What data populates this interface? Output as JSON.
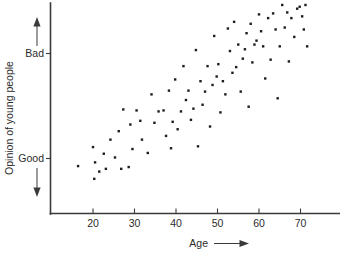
{
  "chart_data": {
    "type": "scatter",
    "title": "",
    "xlabel": "Age",
    "ylabel": "Opinion of young people",
    "xlabel_suffix_icon": "right-arrow",
    "xlim": [
      12,
      78
    ],
    "ylim": [
      0,
      1
    ],
    "grid": false,
    "legend": null,
    "x_ticks": [
      20,
      30,
      40,
      50,
      60,
      70
    ],
    "x_tick_labels": [
      "20",
      "30",
      "40",
      "50",
      "60",
      "70"
    ],
    "y_ticks": [
      0.735,
      0.225
    ],
    "y_tick_labels": [
      "Bad",
      "Good"
    ],
    "y_axis_direction_top": "up-arrow",
    "y_axis_direction_bottom": "down-arrow",
    "marker": "square",
    "marker_color": "#1c1c22",
    "marker_size_px": 2.4,
    "axis_color": "#3a3a3a",
    "background_color": "#ffffff",
    "n_points": 86,
    "points": [
      [
        16.4,
        0.173
      ],
      [
        20.0,
        0.27
      ],
      [
        20.3,
        0.108
      ],
      [
        20.5,
        0.192
      ],
      [
        21.5,
        0.145
      ],
      [
        22.6,
        0.236
      ],
      [
        23.1,
        0.159
      ],
      [
        24.2,
        0.308
      ],
      [
        25.3,
        0.217
      ],
      [
        26.2,
        0.351
      ],
      [
        26.8,
        0.159
      ],
      [
        27.3,
        0.462
      ],
      [
        28.6,
        0.168
      ],
      [
        29.0,
        0.385
      ],
      [
        29.5,
        0.26
      ],
      [
        30.5,
        0.457
      ],
      [
        31.4,
        0.404
      ],
      [
        31.8,
        0.308
      ],
      [
        33.2,
        0.24
      ],
      [
        34.1,
        0.539
      ],
      [
        34.8,
        0.394
      ],
      [
        35.8,
        0.452
      ],
      [
        37.0,
        0.457
      ],
      [
        37.6,
        0.327
      ],
      [
        38.3,
        0.558
      ],
      [
        38.8,
        0.264
      ],
      [
        39.2,
        0.399
      ],
      [
        39.8,
        0.615
      ],
      [
        40.4,
        0.361
      ],
      [
        41.2,
        0.452
      ],
      [
        41.8,
        0.683
      ],
      [
        42.4,
        0.51
      ],
      [
        43.0,
        0.558
      ],
      [
        43.6,
        0.409
      ],
      [
        44.2,
        0.466
      ],
      [
        44.8,
        0.765
      ],
      [
        45.3,
        0.274
      ],
      [
        45.9,
        0.606
      ],
      [
        46.4,
        0.486
      ],
      [
        47.0,
        0.553
      ],
      [
        47.6,
        0.683
      ],
      [
        48.2,
        0.375
      ],
      [
        48.8,
        0.587
      ],
      [
        49.2,
        0.837
      ],
      [
        49.8,
        0.63
      ],
      [
        50.2,
        0.693
      ],
      [
        50.7,
        0.447
      ],
      [
        51.3,
        0.606
      ],
      [
        51.9,
        0.539
      ],
      [
        52.5,
        0.875
      ],
      [
        53.0,
        0.76
      ],
      [
        53.6,
        0.649
      ],
      [
        54.0,
        0.909
      ],
      [
        54.5,
        0.678
      ],
      [
        55.0,
        0.793
      ],
      [
        55.6,
        0.553
      ],
      [
        56.1,
        0.721
      ],
      [
        56.6,
        0.769
      ],
      [
        57.0,
        0.851
      ],
      [
        57.5,
        0.476
      ],
      [
        58.0,
        0.899
      ],
      [
        58.4,
        0.702
      ],
      [
        58.9,
        0.793
      ],
      [
        59.4,
        0.813
      ],
      [
        60.0,
        0.947
      ],
      [
        60.5,
        0.861
      ],
      [
        61.0,
        0.784
      ],
      [
        61.5,
        0.62
      ],
      [
        62.2,
        0.928
      ],
      [
        62.8,
        0.716
      ],
      [
        63.4,
        0.952
      ],
      [
        64.0,
        0.87
      ],
      [
        64.5,
        0.519
      ],
      [
        65.0,
        0.784
      ],
      [
        65.6,
        0.995
      ],
      [
        66.2,
        0.88
      ],
      [
        66.8,
        0.957
      ],
      [
        67.2,
        0.707
      ],
      [
        67.8,
        0.928
      ],
      [
        68.5,
        0.832
      ],
      [
        69.2,
        0.976
      ],
      [
        69.8,
        0.986
      ],
      [
        70.4,
        0.937
      ],
      [
        70.8,
        0.87
      ],
      [
        71.2,
        0.995
      ],
      [
        71.6,
        0.784
      ]
    ]
  },
  "axes": {
    "x_axis_title": "Age",
    "y_axis_title": "Opinion of young people",
    "y_high_label": "Bad",
    "y_low_label": "Good",
    "x_tick_labels": [
      "20",
      "30",
      "40",
      "50",
      "60",
      "70"
    ]
  }
}
